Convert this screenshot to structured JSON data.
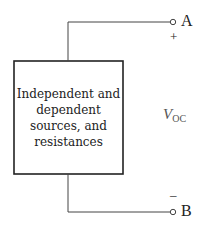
{
  "diagram": {
    "type": "circuit",
    "block": {
      "lines": [
        "Independent and",
        "dependent",
        "sources, and",
        "resistances"
      ]
    },
    "terminals": {
      "top": {
        "label": "A",
        "polarity": "+"
      },
      "bottom": {
        "label": "B",
        "polarity": "–"
      }
    },
    "voltage": {
      "symbol": "V",
      "subscript": "OC"
    }
  }
}
